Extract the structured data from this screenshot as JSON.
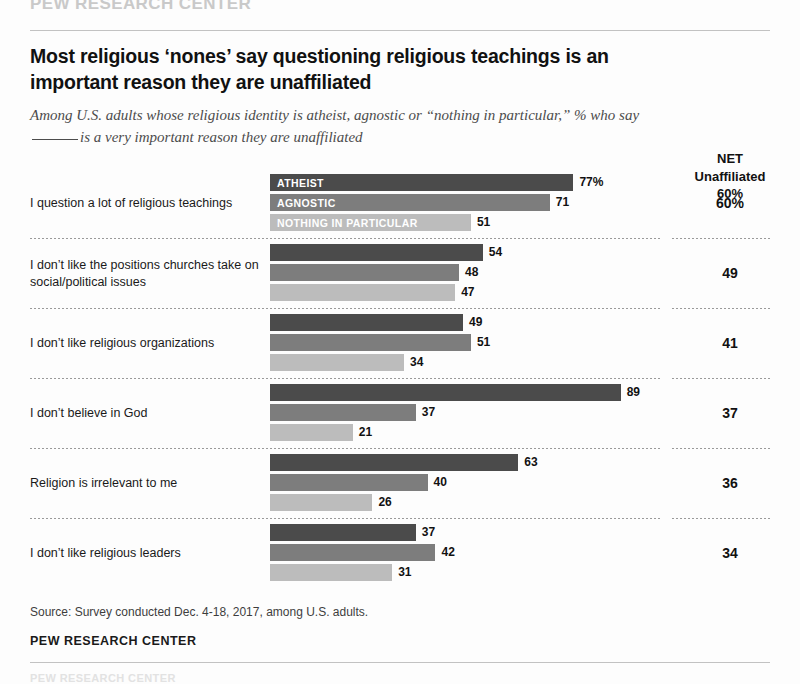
{
  "header": {
    "ghost_brand": "PEW RESEARCH CENTER",
    "title": "Most religious ‘nones’ say questioning religious teachings is an important reason they are unaffiliated",
    "subtitle_part1": "Among U.S. adults whose religious identity is atheist, agnostic or “nothing in particular,” % who say",
    "subtitle_part2": "is a very important reason they are unaffiliated"
  },
  "net_column": {
    "line1": "NET",
    "line2": "Unaffiliated",
    "line3": "60%"
  },
  "footer": {
    "source": "Source: Survey conducted Dec. 4-18, 2017, among U.S. adults.",
    "brand": "PEW RESEARCH CENTER"
  },
  "chart_data": {
    "type": "bar",
    "title": "Most religious ‘nones’ say questioning religious teachings is an important reason they are unaffiliated",
    "subtitle": "Among U.S. adults whose religious identity is atheist, agnostic or “nothing in particular,” % who say ____ is a very important reason they are unaffiliated",
    "orientation": "horizontal",
    "xlabel": "",
    "ylabel": "",
    "xlim": [
      0,
      100
    ],
    "grid": false,
    "legend_position": "in-bar",
    "legend": [
      "ATHEIST",
      "AGNOSTIC",
      "NOTHING IN PARTICULAR"
    ],
    "series_colors": [
      "#4b4b4b",
      "#7d7d7d",
      "#bcbcbc"
    ],
    "categories": [
      "I question a lot of religious teachings",
      "I don’t like the positions churches take on social/political issues",
      "I don’t like religious organizations",
      "I don’t believe in God",
      "Religion is irrelevant to me",
      "I don’t like religious leaders"
    ],
    "series": [
      {
        "name": "ATHEIST",
        "values": [
          77,
          54,
          49,
          89,
          63,
          37
        ]
      },
      {
        "name": "AGNOSTIC",
        "values": [
          71,
          48,
          51,
          37,
          40,
          42
        ]
      },
      {
        "name": "NOTHING IN PARTICULAR",
        "values": [
          51,
          47,
          34,
          21,
          26,
          31
        ]
      }
    ],
    "value_labels": [
      [
        "77%",
        "71",
        "51"
      ],
      [
        "54",
        "48",
        "47"
      ],
      [
        "49",
        "51",
        "34"
      ],
      [
        "89",
        "37",
        "21"
      ],
      [
        "63",
        "40",
        "26"
      ],
      [
        "37",
        "42",
        "31"
      ]
    ],
    "net_label": "NET Unaffiliated",
    "net_values": [
      "60%",
      "49",
      "41",
      "37",
      "36",
      "34"
    ],
    "source": "Source: Survey conducted Dec. 4-18, 2017, among U.S. adults."
  }
}
